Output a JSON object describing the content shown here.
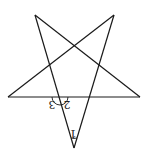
{
  "diagram": {
    "type": "pentagram",
    "stroke_color": "#1a1a1a",
    "vertices": {
      "top_left": [
        35,
        15
      ],
      "top_right": [
        114,
        15
      ],
      "left": [
        8,
        97
      ],
      "right": [
        140,
        97
      ],
      "bottom": [
        74,
        148
      ]
    },
    "angle_labels": [
      {
        "id": "angle-1",
        "text": "1",
        "x": 73,
        "y": 132,
        "rotation": 180
      },
      {
        "id": "angle-2",
        "text": "2",
        "x": 68,
        "y": 107,
        "rotation": 180
      },
      {
        "id": "angle-3",
        "text": "3",
        "x": 50,
        "y": 107,
        "rotation": 180
      }
    ]
  }
}
